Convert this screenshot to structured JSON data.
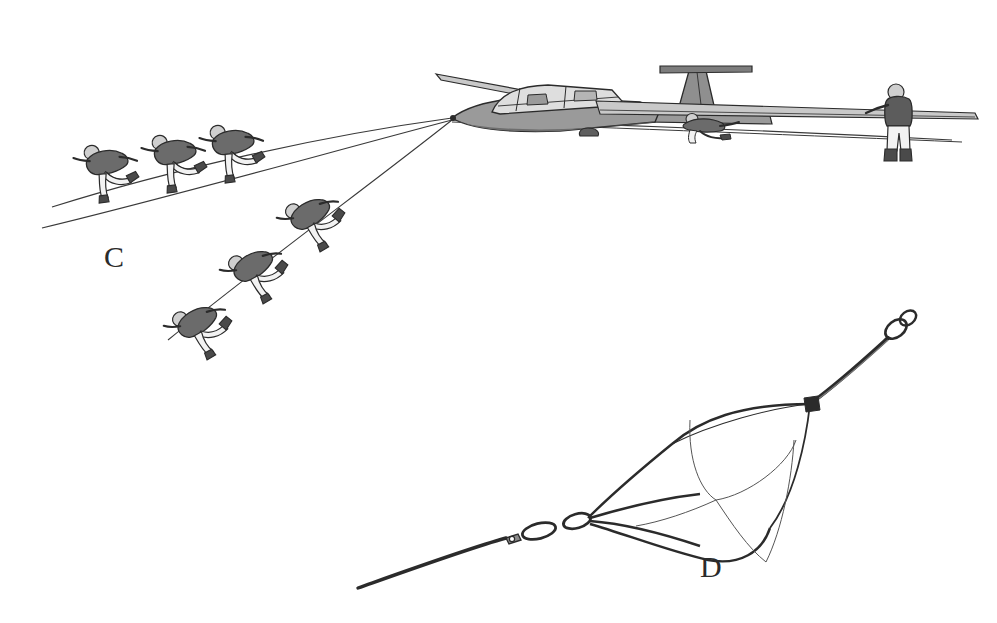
{
  "figure": {
    "background_color": "#ffffff",
    "width": 997,
    "height": 623
  },
  "panels": [
    {
      "id": "panel-c",
      "label": "C",
      "label_x": 104,
      "label_y": 242,
      "caption": "Bungee rope launch with ground crew running",
      "subject": "sailplane-with-launch-crew"
    },
    {
      "id": "panel-d",
      "label": "D",
      "label_x": 700,
      "label_y": 552,
      "caption": "Drogue parachute, rings and weak link on tow cable",
      "subject": "drogue-parachute-assembly"
    }
  ],
  "colors": {
    "ink": "#2b2b2b",
    "line": "#3a3a3a",
    "fuselage_fill": "#9a9a9a",
    "fuselage_dark": "#6e6e6e",
    "wing_fill": "#c9c9c9",
    "canopy_fill": "#dedede",
    "figure_torso": "#6b6b6b",
    "figure_legs": "#f2f2f2",
    "figure_boots": "#4a4a4a",
    "figure_head": "#cfcfcf",
    "background": "#ffffff"
  },
  "glider": {
    "name": "two-seat-sailplane",
    "tail_type": "t-tail",
    "nose_x": 452,
    "nose_y": 118,
    "occupants": 2,
    "parts": [
      "nose",
      "cockpit-canopy",
      "fuselage",
      "near-wing",
      "far-wing",
      "fin",
      "tailplane",
      "main-wheel",
      "tow-hook"
    ]
  },
  "crew": {
    "upper_line_runners": 3,
    "lower_line_runners": 3,
    "wing_runner": 1,
    "tail_holder": 1,
    "total": 8
  },
  "launch_lines": [
    {
      "name": "upper-bungee-leg",
      "from": "lower-left",
      "to": "glider-nose"
    },
    {
      "name": "lower-bungee-leg",
      "from": "lower-left",
      "to": "glider-nose"
    },
    {
      "name": "second-crew-rope",
      "from": "lower-left-steep",
      "to": "glider-nose"
    },
    {
      "name": "retrieve-line",
      "from": "glider-nose",
      "to": "right-edge"
    }
  ],
  "parachute": {
    "name": "drogue-parachute",
    "canopy_panels": 3,
    "rigging_lines": 4,
    "hardware": [
      "tow-ring-pair",
      "chain-link",
      "weak-link-fitting"
    ],
    "cable_direction": "lower-left-to-upper-right"
  }
}
